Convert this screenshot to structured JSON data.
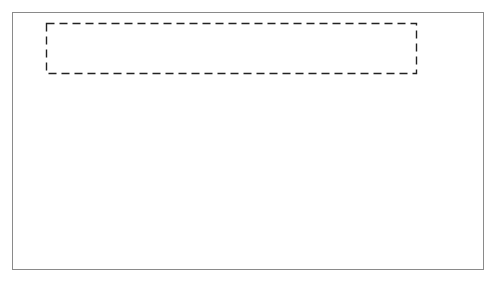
{
  "diagram": {
    "top_system": {
      "flow_meter": {
        "line1": "Flow",
        "line2": "meter"
      },
      "raw_signal_label": "Raw Signal (s)",
      "processing_software": {
        "line1": "Processing",
        "line2": "software"
      },
      "flow_rate_label": "Flow rate (f)"
    },
    "model": {
      "input": "s",
      "block": "SM1",
      "output": "f"
    },
    "divide_and_conquer_label": "Divide and Conquer",
    "decomposed": {
      "input": "s",
      "blocks": [
        {
          "line1": "Linearization",
          "line2": ""
        },
        {
          "line1": "Square root",
          "line2": "calculation"
        },
        {
          "line1": "Scaling",
          "line2": ""
        }
      ],
      "output": "f"
    },
    "colors": {
      "frame": "#8a8a8a",
      "stroke": "#333333",
      "text": "#555555",
      "arrow": "#111111"
    }
  }
}
